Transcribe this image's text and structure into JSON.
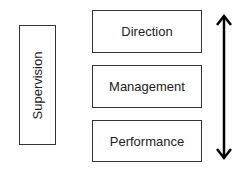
{
  "diagram": {
    "side_box": {
      "label": "Supervision"
    },
    "levels": [
      {
        "label": "Direction"
      },
      {
        "label": "Management"
      },
      {
        "label": "Performance"
      }
    ],
    "arrow": {
      "type": "bidirectional-vertical",
      "color": "#000000"
    },
    "colors": {
      "border": "#333333",
      "text": "#222222",
      "background": "#ffffff"
    }
  }
}
